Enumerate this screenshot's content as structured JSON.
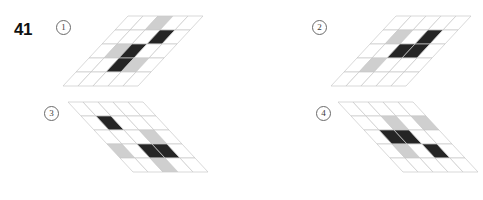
{
  "question": {
    "number": "41"
  },
  "palette": {
    "background": "#ffffff",
    "grid_line": "#c8c8c8",
    "cell_empty": "#ffffff",
    "cell_gray": "#cfcfcf",
    "cell_dark": "#252525",
    "text": "#111111",
    "marker_border": "#6a6a6a"
  },
  "options": [
    {
      "id": "opt1",
      "marker": "①",
      "marker_label": "1",
      "grid": {
        "rows": 5,
        "cols": 5,
        "slant": "right",
        "cell_w": 15,
        "cell_h": 14,
        "skew_x": -13,
        "cells": [
          [
            "empty",
            "empty",
            "gray",
            "empty",
            "empty"
          ],
          [
            "empty",
            "empty",
            "empty",
            "dark",
            "empty"
          ],
          [
            "empty",
            "gray",
            "dark",
            "empty",
            "empty"
          ],
          [
            "empty",
            "empty",
            "dark",
            "gray",
            "empty"
          ],
          [
            "empty",
            "empty",
            "empty",
            "empty",
            "empty"
          ]
        ]
      }
    },
    {
      "id": "opt2",
      "marker": "②",
      "marker_label": "2",
      "grid": {
        "rows": 5,
        "cols": 5,
        "slant": "right",
        "cell_w": 15,
        "cell_h": 14,
        "skew_x": -13,
        "cells": [
          [
            "empty",
            "empty",
            "empty",
            "empty",
            "empty"
          ],
          [
            "empty",
            "gray",
            "empty",
            "dark",
            "empty"
          ],
          [
            "empty",
            "empty",
            "dark",
            "dark",
            "empty"
          ],
          [
            "empty",
            "gray",
            "empty",
            "empty",
            "empty"
          ],
          [
            "empty",
            "empty",
            "empty",
            "empty",
            "empty"
          ]
        ]
      }
    },
    {
      "id": "opt3",
      "marker": "③",
      "marker_label": "3",
      "grid": {
        "rows": 5,
        "cols": 5,
        "slant": "left",
        "cell_w": 15,
        "cell_h": 14,
        "skew_x": 13,
        "cells": [
          [
            "empty",
            "empty",
            "empty",
            "empty",
            "empty"
          ],
          [
            "empty",
            "dark",
            "empty",
            "empty",
            "empty"
          ],
          [
            "empty",
            "empty",
            "empty",
            "gray",
            "empty"
          ],
          [
            "gray",
            "empty",
            "dark",
            "dark",
            "empty"
          ],
          [
            "empty",
            "empty",
            "gray",
            "empty",
            "empty"
          ]
        ]
      }
    },
    {
      "id": "opt4",
      "marker": "④",
      "marker_label": "4",
      "grid": {
        "rows": 5,
        "cols": 5,
        "slant": "left",
        "cell_w": 15,
        "cell_h": 14,
        "skew_x": 13,
        "cells": [
          [
            "empty",
            "empty",
            "empty",
            "empty",
            "empty"
          ],
          [
            "empty",
            "empty",
            "gray",
            "empty",
            "gray"
          ],
          [
            "empty",
            "dark",
            "dark",
            "empty",
            "empty"
          ],
          [
            "empty",
            "gray",
            "empty",
            "dark",
            "empty"
          ],
          [
            "empty",
            "empty",
            "empty",
            "empty",
            "empty"
          ]
        ]
      }
    }
  ]
}
